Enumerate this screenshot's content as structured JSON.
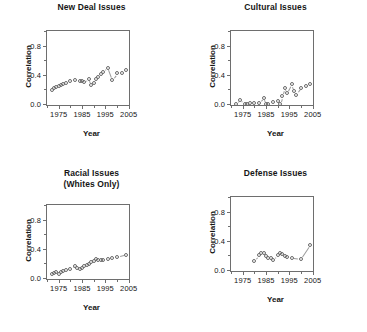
{
  "figure": {
    "layout": "2x2 grid of scatter panels",
    "panel_count": 4
  },
  "axis_labels": {
    "x_title": "Year",
    "y_title": "Correlation"
  },
  "axes": {
    "x_ticks_major": [
      "1975",
      "1985",
      "1995",
      "2005"
    ],
    "x_tick_values_major": [
      1975,
      1985,
      1995,
      2005
    ],
    "x_tick_values_minor": [
      1970,
      1980,
      1990,
      2000
    ],
    "y_ticks_major": [
      "0.0",
      "0.4",
      "0.8"
    ],
    "y_tick_values_major": [
      0.0,
      0.4,
      0.8
    ],
    "y_tick_values_minor": [
      0.2,
      0.6,
      1.0
    ],
    "xlim": [
      1970,
      2006
    ],
    "ylim": [
      -0.04,
      1.0
    ]
  },
  "colors": {
    "frame": "#6e6e6e",
    "marker": "#6a6a6a",
    "connector": "#9a9a9a",
    "text": "#161616",
    "background": "#ffffff"
  },
  "chart_data": [
    {
      "type": "scatter",
      "title": "New Deal Issues",
      "title_line2": "",
      "xlabel": "Year",
      "ylabel": "Correlation",
      "xlim": [
        1970,
        2006
      ],
      "ylim": [
        -0.04,
        1.0
      ],
      "grid": false,
      "legend": "none",
      "x": [
        1972,
        1973,
        1974,
        1975,
        1976,
        1977,
        1978,
        1980,
        1982,
        1984,
        1985,
        1986,
        1988,
        1989,
        1990,
        1991,
        1992,
        1993,
        1994,
        1996,
        1998,
        2000,
        2002,
        2004
      ],
      "y": [
        0.19,
        0.22,
        0.23,
        0.25,
        0.26,
        0.27,
        0.29,
        0.32,
        0.33,
        0.32,
        0.31,
        0.3,
        0.35,
        0.26,
        0.29,
        0.34,
        0.37,
        0.41,
        0.44,
        0.5,
        0.33,
        0.42,
        0.43,
        0.46
      ]
    },
    {
      "type": "scatter",
      "title": "Cultural Issues",
      "title_line2": "",
      "xlabel": "Year",
      "ylabel": "Correlation",
      "xlim": [
        1970,
        2006
      ],
      "ylim": [
        -0.04,
        1.0
      ],
      "grid": false,
      "legend": "none",
      "x": [
        1972,
        1974,
        1976,
        1977,
        1978,
        1980,
        1982,
        1984,
        1985,
        1986,
        1988,
        1990,
        1991,
        1992,
        1993,
        1994,
        1996,
        1997,
        1998,
        2000,
        2002,
        2004
      ],
      "y": [
        0.0,
        0.06,
        0.0,
        0.0,
        0.01,
        0.01,
        0.02,
        0.09,
        0.0,
        0.0,
        0.03,
        0.04,
        0.0,
        0.11,
        0.22,
        0.15,
        0.27,
        0.18,
        0.13,
        0.22,
        0.25,
        0.27
      ]
    },
    {
      "type": "scatter",
      "title": "Racial Issues",
      "title_line2": "(Whites Only)",
      "xlabel": "Year",
      "ylabel": "Correlation",
      "xlim": [
        1970,
        2006
      ],
      "ylim": [
        -0.04,
        1.0
      ],
      "grid": false,
      "legend": "none",
      "x": [
        1972,
        1973,
        1974,
        1975,
        1976,
        1977,
        1978,
        1980,
        1982,
        1983,
        1984,
        1985,
        1986,
        1987,
        1988,
        1989,
        1990,
        1991,
        1992,
        1993,
        1994,
        1996,
        1998,
        2000,
        2004
      ],
      "y": [
        0.06,
        0.07,
        0.08,
        0.05,
        0.09,
        0.1,
        0.11,
        0.13,
        0.17,
        0.14,
        0.12,
        0.14,
        0.17,
        0.18,
        0.19,
        0.22,
        0.24,
        0.26,
        0.25,
        0.25,
        0.25,
        0.26,
        0.27,
        0.29,
        0.32
      ]
    },
    {
      "type": "scatter",
      "title": "Defense Issues",
      "title_line2": "",
      "xlabel": "Year",
      "ylabel": "Correlation",
      "xlim": [
        1970,
        2006
      ],
      "ylim": [
        -0.04,
        1.0
      ],
      "grid": false,
      "legend": "none",
      "x": [
        1980,
        1982,
        1983,
        1984,
        1985,
        1986,
        1987,
        1988,
        1990,
        1991,
        1992,
        1993,
        1994,
        1996,
        2000,
        2004
      ],
      "y": [
        0.13,
        0.21,
        0.24,
        0.23,
        0.19,
        0.17,
        0.16,
        0.14,
        0.2,
        0.23,
        0.22,
        0.19,
        0.18,
        0.17,
        0.15,
        0.34
      ]
    }
  ]
}
